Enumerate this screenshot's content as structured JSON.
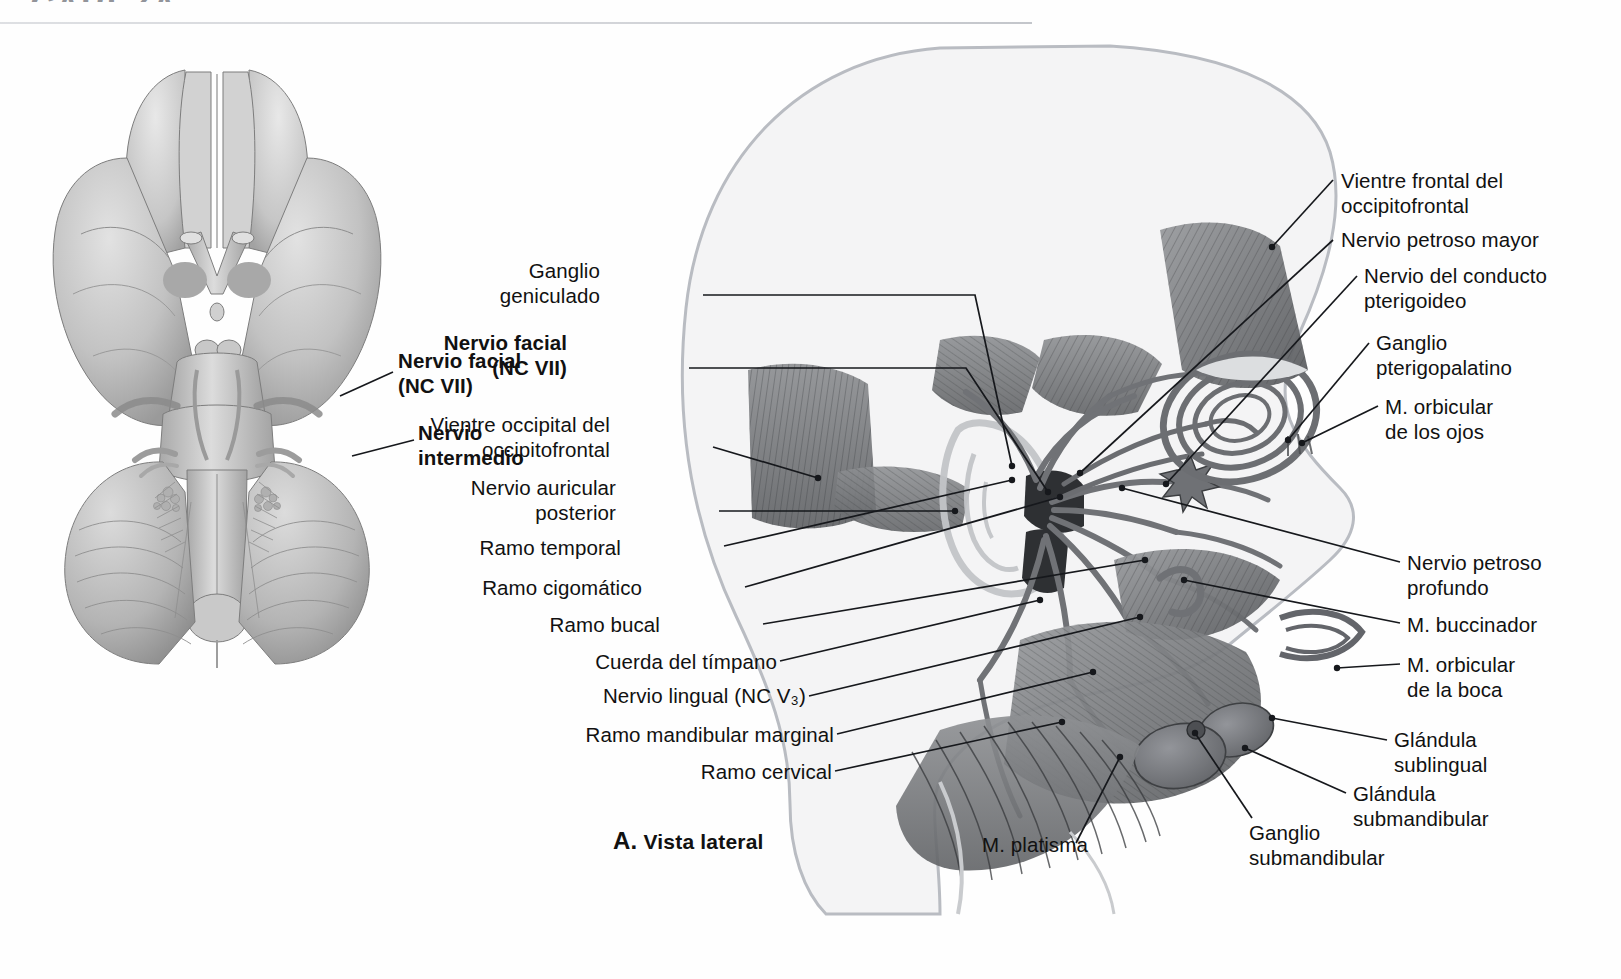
{
  "page": {
    "header_fragment": "CABEZA",
    "caption_letter": "A.",
    "caption_text": "Vista lateral",
    "figure_title": "Nervio facial (NC VII) — Vista lateral"
  },
  "colors": {
    "ink": "#16181c",
    "text": "#111111",
    "silhouette_stroke": "#b9bcc2",
    "silhouette_fill": "#f4f4f5",
    "muscle_dark": "#5d5f62",
    "muscle_mid": "#8a8c8f",
    "muscle_light": "#b6b8bb",
    "nerve": "#6f7174",
    "rule": "#cbcdd2"
  },
  "left_figure": {
    "name": "inferior-view-of-brain",
    "labels": [
      {
        "id": "nervio-facial-nc-vii",
        "text": "Nervio facial\n(NC VII)",
        "bold": true,
        "x": 398,
        "y": 348,
        "align": "left",
        "leader": {
          "from": [
            393,
            372
          ],
          "to": [
            340,
            396
          ]
        }
      },
      {
        "id": "nervio-intermedio",
        "text": "Nervio\nintermedio",
        "bold": true,
        "x": 418,
        "y": 420,
        "align": "left",
        "leader": {
          "from": [
            414,
            440
          ],
          "to": [
            352,
            456
          ]
        }
      }
    ]
  },
  "right_figure": {
    "name": "lateral-view-of-head",
    "left_labels": [
      {
        "id": "ganglio-geniculado",
        "text": "Ganglio\ngeniculado",
        "bold": false,
        "x": 600,
        "y": 258,
        "align": "right",
        "anchor_x": 700,
        "anchor_y": 295,
        "path": [
          [
            703,
            295
          ],
          [
            975,
            295
          ],
          [
            1012,
            466
          ]
        ]
      },
      {
        "id": "nervio-facial-nc-vii-lat",
        "text": "Nervio facial\n(NC VII)",
        "bold": true,
        "x": 567,
        "y": 330,
        "align": "right",
        "anchor_x": 686,
        "anchor_y": 368,
        "path": [
          [
            689,
            368
          ],
          [
            966,
            368
          ],
          [
            1048,
            492
          ]
        ]
      },
      {
        "id": "vientre-occipital-del-occipitofrontal",
        "text": "Vientre occipital del\noccipitofrontal",
        "bold": false,
        "x": 533,
        "y": 412,
        "align": "right",
        "anchor_x": 710,
        "anchor_y": 447,
        "path": [
          [
            713,
            447
          ],
          [
            818,
            478
          ]
        ]
      },
      {
        "id": "nervio-auricular-posterior",
        "text": "Nervio auricular\nposterior",
        "bold": false,
        "x": 575,
        "y": 475,
        "align": "right",
        "anchor_x": 716,
        "anchor_y": 511,
        "path": [
          [
            719,
            511
          ],
          [
            955,
            511
          ]
        ]
      },
      {
        "id": "ramo-temporal",
        "text": "Ramo temporal",
        "bold": false,
        "x": 586,
        "y": 535,
        "align": "right",
        "anchor_x": 721,
        "anchor_y": 546,
        "path": [
          [
            724,
            546
          ],
          [
            1012,
            480
          ]
        ]
      },
      {
        "id": "ramo-cigomatico",
        "text": "Ramo cigomático",
        "bold": false,
        "x": 597,
        "y": 575,
        "align": "right",
        "anchor_x": 742,
        "anchor_y": 587,
        "path": [
          [
            745,
            587
          ],
          [
            1060,
            497
          ]
        ]
      },
      {
        "id": "ramo-bucal",
        "text": "Ramo bucal",
        "bold": false,
        "x": 657,
        "y": 612,
        "align": "right",
        "anchor_x": 760,
        "anchor_y": 624,
        "path": [
          [
            763,
            624
          ],
          [
            1145,
            560
          ]
        ]
      },
      {
        "id": "cuerda-del-timpano",
        "text": "Cuerda del tímpano",
        "bold": false,
        "x": 616,
        "y": 649,
        "align": "right",
        "anchor_x": 777,
        "anchor_y": 661,
        "path": [
          [
            780,
            661
          ],
          [
            1040,
            600
          ]
        ]
      },
      {
        "id": "nervio-lingual-nc-v3",
        "text": "Nervio lingual (NC V₃)",
        "bold": false,
        "x": 627,
        "y": 683,
        "align": "right",
        "anchor_x": 806,
        "anchor_y": 696,
        "path": [
          [
            809,
            696
          ],
          [
            1140,
            617
          ]
        ]
      },
      {
        "id": "ramo-mandibular-marginal",
        "text": "Ramo mandibular marginal",
        "bold": false,
        "x": 611,
        "y": 722,
        "align": "right",
        "anchor_x": 834,
        "anchor_y": 734,
        "path": [
          [
            837,
            734
          ],
          [
            1093,
            672
          ]
        ]
      },
      {
        "id": "ramo-cervical",
        "text": "Ramo cervical",
        "bold": false,
        "x": 714,
        "y": 759,
        "align": "right",
        "anchor_x": 832,
        "anchor_y": 771,
        "path": [
          [
            835,
            771
          ],
          [
            1062,
            722
          ]
        ]
      }
    ],
    "right_labels": [
      {
        "id": "vientre-frontal-del-occipitofrontal",
        "text": "Vientre frontal del\noccipitofrontal",
        "bold": false,
        "x": 1341,
        "y": 168,
        "align": "left",
        "anchor_x": 1336,
        "anchor_y": 180,
        "path": [
          [
            1333,
            180
          ],
          [
            1272,
            247
          ]
        ]
      },
      {
        "id": "nervio-petroso-mayor",
        "text": "Nervio petroso mayor",
        "bold": false,
        "x": 1341,
        "y": 227,
        "align": "left",
        "anchor_x": 1336,
        "anchor_y": 240,
        "path": [
          [
            1333,
            240
          ],
          [
            1080,
            473
          ]
        ]
      },
      {
        "id": "nervio-del-conducto-pterigoideo",
        "text": "Nervio del conducto\npterigoideo",
        "bold": false,
        "x": 1364,
        "y": 263,
        "align": "left",
        "anchor_x": 1360,
        "anchor_y": 276,
        "path": [
          [
            1357,
            276
          ],
          [
            1166,
            484
          ]
        ]
      },
      {
        "id": "ganglio-pterigopalatino",
        "text": "Ganglio\npterigopalatino",
        "bold": false,
        "x": 1376,
        "y": 330,
        "align": "left",
        "anchor_x": 1372,
        "anchor_y": 343,
        "path": [
          [
            1369,
            343
          ],
          [
            1288,
            440
          ]
        ]
      },
      {
        "id": "m-orbicular-de-los-ojos",
        "text": "M. orbicular\nde los ojos",
        "bold": false,
        "x": 1385,
        "y": 394,
        "align": "left",
        "anchor_x": 1381,
        "anchor_y": 406,
        "path": [
          [
            1378,
            406
          ],
          [
            1302,
            443
          ]
        ]
      },
      {
        "id": "nervio-petroso-profundo",
        "text": "Nervio petroso\nprofundo",
        "bold": false,
        "x": 1407,
        "y": 550,
        "align": "left",
        "anchor_x": 1403,
        "anchor_y": 562,
        "path": [
          [
            1400,
            562
          ],
          [
            1122,
            488
          ]
        ]
      },
      {
        "id": "m-buccinador",
        "text": "M. buccinador",
        "bold": false,
        "x": 1407,
        "y": 612,
        "align": "left",
        "anchor_x": 1403,
        "anchor_y": 623,
        "path": [
          [
            1400,
            623
          ],
          [
            1184,
            580
          ]
        ]
      },
      {
        "id": "m-orbicular-de-la-boca",
        "text": "M. orbicular\nde la boca",
        "bold": false,
        "x": 1407,
        "y": 652,
        "align": "left",
        "anchor_x": 1403,
        "anchor_y": 664,
        "path": [
          [
            1400,
            664
          ],
          [
            1337,
            668
          ]
        ]
      },
      {
        "id": "glandula-sublingual",
        "text": "Glándula\nsublingual",
        "bold": false,
        "x": 1394,
        "y": 727,
        "align": "left",
        "anchor_x": 1390,
        "anchor_y": 740,
        "path": [
          [
            1387,
            740
          ],
          [
            1272,
            718
          ]
        ]
      },
      {
        "id": "glandula-submandibular",
        "text": "Glándula\nsubmandibular",
        "bold": false,
        "x": 1353,
        "y": 781,
        "align": "left",
        "anchor_x": 1349,
        "anchor_y": 793,
        "path": [
          [
            1346,
            793
          ],
          [
            1245,
            748
          ]
        ]
      }
    ],
    "bottom_labels": [
      {
        "id": "m-platisma",
        "text": "M. platisma",
        "bold": false,
        "x": 982,
        "y": 832,
        "align": "left",
        "anchor_x": 1073,
        "anchor_y": 843,
        "path": [
          [
            1076,
            843
          ],
          [
            1120,
            757
          ]
        ]
      },
      {
        "id": "ganglio-submandibular",
        "text": "Ganglio\nsubmandibular",
        "bold": false,
        "x": 1249,
        "y": 820,
        "align": "left",
        "anchor_x": 1245,
        "anchor_y": 832,
        "path": [
          [
            1252,
            818
          ],
          [
            1195,
            733
          ]
        ]
      }
    ]
  }
}
